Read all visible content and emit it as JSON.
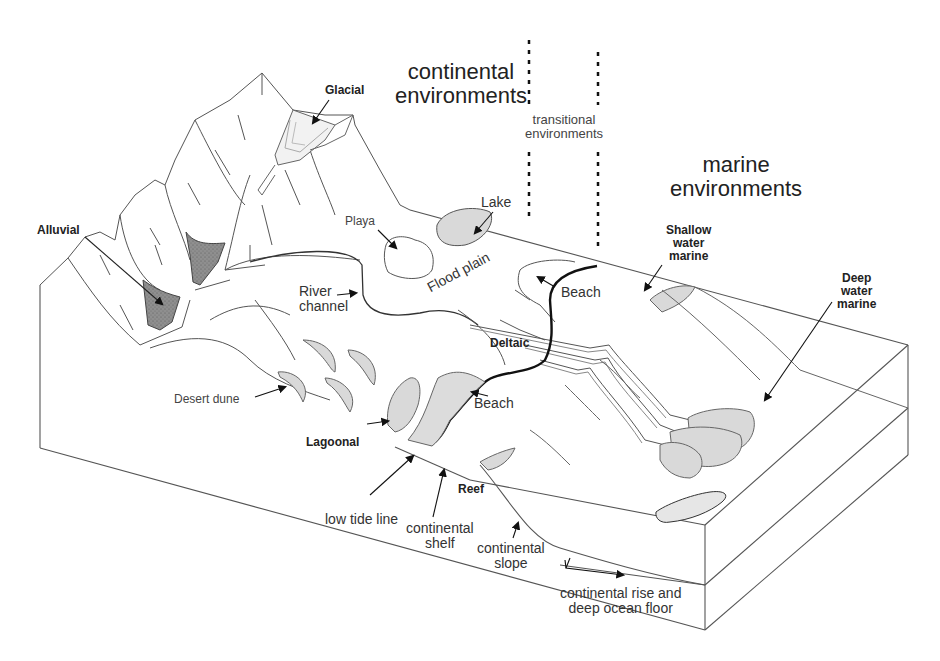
{
  "diagram": {
    "type": "block-diagram",
    "colors": {
      "line": "#555555",
      "dark_line": "#111111",
      "fill_light": "#d9d9d9",
      "fill_dark": "#8a8a8a",
      "background": "#ffffff"
    },
    "zones": [
      {
        "id": "continental",
        "line1": "continental",
        "line2": "environments"
      },
      {
        "id": "transitional",
        "line1": "transitional",
        "line2": "environments"
      },
      {
        "id": "marine",
        "line1": "marine",
        "line2": "environments"
      }
    ],
    "labels": {
      "glacial": "Glacial",
      "alluvial": "Alluvial",
      "playa": "Playa",
      "lake": "Lake",
      "river_channel_1": "River",
      "river_channel_2": "channel",
      "flood_plain": "Flood plain",
      "beach_upper": "Beach",
      "beach_lower": "Beach",
      "deltaic": "Deltaic",
      "desert_dune": "Desert dune",
      "lagoonal": "Lagoonal",
      "reef": "Reef",
      "shallow_1": "Shallow",
      "shallow_2": "water",
      "shallow_3": "marine",
      "deep_1": "Deep",
      "deep_2": "water",
      "deep_3": "marine",
      "low_tide_line": "low tide line",
      "shelf_1": "continental",
      "shelf_2": "shelf",
      "slope_1": "continental",
      "slope_2": "slope",
      "rise_1": "continental rise and",
      "rise_2": "deep ocean floor"
    }
  }
}
